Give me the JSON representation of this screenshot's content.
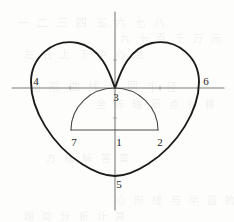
{
  "figure": {
    "type": "geometric-diagram",
    "background_color": "#fdfdfb",
    "curve_color": "#1b1b1b",
    "axis_color": "#7d7d78",
    "semicircle_color": "#4a4a46",
    "label_color": "#1b1b1b"
  },
  "axes": {
    "horizontal": {
      "x1": 12,
      "y1": 88,
      "x2": 224,
      "y2": 88,
      "stroke": "#7d7d78",
      "stroke_width": 1.1
    },
    "vertical": {
      "x1": 115,
      "y1": 12,
      "x2": 115,
      "y2": 210,
      "stroke": "#7d7d78",
      "stroke_width": 1.1
    },
    "origin": {
      "x": 115,
      "y": 88
    }
  },
  "heart_curve": {
    "name": "cardioid",
    "stroke": "#1b1b1b",
    "stroke_width": 1.9,
    "cusp": {
      "x": 115,
      "y": 88
    },
    "bottom": {
      "x": 115,
      "y": 176
    },
    "left_extreme": {
      "x": 31,
      "y": 88
    },
    "right_extreme": {
      "x": 200,
      "y": 88
    },
    "left_lobe_top": {
      "x": 72,
      "y": 42
    },
    "right_lobe_top": {
      "x": 158,
      "y": 42
    },
    "path": "M 115 88 C 110 74 102 48 78 43 C 52 38 31 58 31 82 C 31 110 52 145 82 164 C 96 173 106 176 115 176 C 124 176 134 173 148 164 C 178 145 199 110 199 82 C 199 58 178 38 152 43 C 128 48 120 74 115 88 Z"
  },
  "semicircle": {
    "name": "inscribed-semicircle",
    "stroke": "#4a4a46",
    "stroke_width": 1.1,
    "center": {
      "x": 114.5,
      "y": 130
    },
    "radius": 43.5,
    "left_end": {
      "x": 71,
      "y": 130
    },
    "right_end": {
      "x": 158,
      "y": 130
    },
    "apex": {
      "x": 114.5,
      "y": 88
    },
    "arc_path": "M 71 130 A 43.5 42 0 0 1 158 130",
    "chord_path": "M 71 130 L 158 130"
  },
  "labels": [
    {
      "id": "label-1",
      "text": "1",
      "x": 119,
      "y": 142,
      "describes": "center of the semicircle chord, on the vertical axis"
    },
    {
      "id": "label-2",
      "text": "2",
      "x": 160,
      "y": 142,
      "describes": "right endpoint of the semicircle chord"
    },
    {
      "id": "label-3",
      "text": "3",
      "x": 116,
      "y": 97,
      "describes": "cusp of the heart curve at the origin"
    },
    {
      "id": "label-4",
      "text": "4",
      "x": 36,
      "y": 81,
      "describes": "leftmost point of the heart curve on the horizontal axis"
    },
    {
      "id": "label-5",
      "text": "5",
      "x": 119,
      "y": 184,
      "describes": "bottom point of the heart curve on the vertical axis"
    },
    {
      "id": "label-6",
      "text": "6",
      "x": 206,
      "y": 81,
      "describes": "rightmost point of the heart curve on the horizontal axis"
    },
    {
      "id": "label-7",
      "text": "7",
      "x": 74,
      "y": 142,
      "describes": "left endpoint of the semicircle chord"
    }
  ],
  "tick_marks": [
    {
      "id": "tick-left",
      "x": 70,
      "y": 88
    },
    {
      "id": "tick-right",
      "x": 160,
      "y": 88
    },
    {
      "id": "tick-lower",
      "x": 115,
      "y": 118
    },
    {
      "id": "tick-upper",
      "x": 115,
      "y": 60
    }
  ],
  "ghost_text": {
    "note": "faint scanned bleed-through from the reverse side of the page; not legible content",
    "lines": [
      {
        "text": "一 二 三 四 五 六 七 八",
        "x": 18,
        "y": 14,
        "size": 11
      },
      {
        "text": "九 十 百 千 万 元",
        "x": 120,
        "y": 30,
        "size": 10
      },
      {
        "text": "左 右 上 下 中 心 点",
        "x": 24,
        "y": 46,
        "size": 10
      },
      {
        "text": "图 形 曲 线 半 圆 半 径",
        "x": 30,
        "y": 78,
        "size": 11
      },
      {
        "text": "坐 标 轴 原 点 对 称",
        "x": 96,
        "y": 96,
        "size": 10
      },
      {
        "text": "方 程 解 答 案",
        "x": 46,
        "y": 150,
        "size": 10
      },
      {
        "text": "心 形 线 与 半 圆 的",
        "x": 116,
        "y": 192,
        "size": 10
      },
      {
        "text": "题 目 分 析 计 算",
        "x": 24,
        "y": 208,
        "size": 10
      }
    ]
  }
}
